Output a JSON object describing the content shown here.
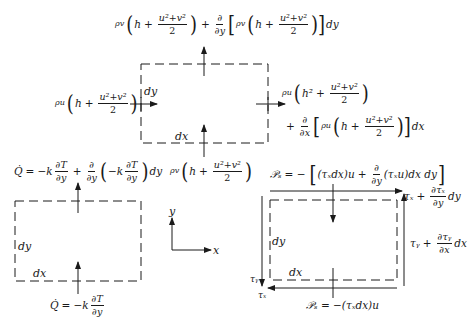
{
  "diagram": {
    "top_element": {
      "label_dy": "dy",
      "label_dx": "dx",
      "flux_top": {
        "pre": "ρv",
        "h": "h",
        "plus": "+",
        "num": "u²+v²",
        "den": "2",
        "deriv_num": "∂",
        "deriv_den": "∂y",
        "inner_pre": "ρv",
        "tail": "dy"
      },
      "flux_left": {
        "pre": "ρu",
        "h": "h",
        "plus": "+",
        "num": "u²+v²",
        "den": "2"
      },
      "flux_right_line1": {
        "pre": "ρu",
        "h": "h²",
        "plus": "+",
        "num": "u²+v²",
        "den": "2"
      },
      "flux_right_line2": {
        "plus": "+",
        "deriv_num": "∂",
        "deriv_den": "∂x",
        "inner_pre": "ρu",
        "h": "h",
        "num": "u²+v²",
        "den": "2",
        "tail": "dx"
      },
      "flux_bottom": {
        "pre": "ρv",
        "h": "h",
        "plus": "+",
        "num": "u²+v²",
        "den": "2"
      }
    },
    "heat_element": {
      "label_dy": "dy",
      "label_dx": "dx",
      "q_top": {
        "lhs": "Q̇",
        "eq": "=",
        "k": "−k",
        "dT": "∂T",
        "dy": "∂y",
        "plus": "+",
        "d": "∂",
        "tail": "dy"
      },
      "q_bottom": {
        "lhs": "Q̇",
        "eq": "=",
        "k": "−k",
        "dT": "∂T",
        "dy": "∂y"
      }
    },
    "axes": {
      "x_label": "x",
      "y_label": "y"
    },
    "shear_element": {
      "label_dy": "dy",
      "label_dx": "dx",
      "work_top": {
        "lhs": "𝒫ₛ",
        "eq": "= −",
        "a": "(τₓdx)u",
        "plus": "+",
        "d_num": "∂",
        "d_den": "∂y",
        "b": "(τₓu)dx dy"
      },
      "work_bottom": "𝒫ₛ = −(τₓdx)u",
      "tau_top": {
        "a": "τₓ",
        "plus": "+",
        "num": "∂τₓ",
        "den": "∂y",
        "tail": "dy"
      },
      "tau_right": {
        "a": "τᵧ",
        "plus": "+",
        "num": "∂τᵧ",
        "den": "∂x",
        "tail": "dx"
      },
      "tau_left": "τᵧ",
      "tau_bottom": "τₓ"
    },
    "colors": {
      "ink": "#1a1a1a",
      "background": "#ffffff"
    }
  }
}
